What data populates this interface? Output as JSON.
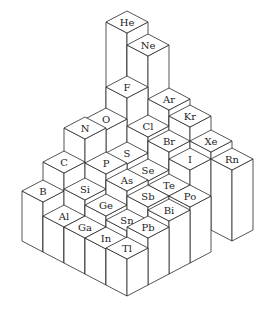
{
  "diagram": {
    "type": "isometric-column-chart",
    "groups": [
      "13",
      "14",
      "15",
      "16",
      "17",
      "18"
    ],
    "periods": [
      "1",
      "2",
      "3",
      "4",
      "5",
      "6"
    ],
    "elements": [
      {
        "symbol": "He",
        "group": 5,
        "period": -1,
        "height": 153
      },
      {
        "symbol": "B",
        "group": 0,
        "period": 0,
        "height": 50
      },
      {
        "symbol": "C",
        "group": 1,
        "period": 0,
        "height": 68
      },
      {
        "symbol": "N",
        "group": 2,
        "period": 0,
        "height": 91
      },
      {
        "symbol": "O",
        "group": 3,
        "period": 0,
        "height": 89
      },
      {
        "symbol": "F",
        "group": 4,
        "period": 0,
        "height": 110
      },
      {
        "symbol": "Ne",
        "group": 5,
        "period": 0,
        "height": 141
      },
      {
        "symbol": "Al",
        "group": 0,
        "period": 1,
        "height": 36
      },
      {
        "symbol": "Si",
        "group": 1,
        "period": 1,
        "height": 52
      },
      {
        "symbol": "P",
        "group": 2,
        "period": 1,
        "height": 67
      },
      {
        "symbol": "S",
        "group": 3,
        "period": 1,
        "height": 66
      },
      {
        "symbol": "Cl",
        "group": 4,
        "period": 1,
        "height": 82
      },
      {
        "symbol": "Ar",
        "group": 5,
        "period": 1,
        "height": 98
      },
      {
        "symbol": "Ga",
        "group": 0,
        "period": 2,
        "height": 36
      },
      {
        "symbol": "Ge",
        "group": 1,
        "period": 2,
        "height": 47
      },
      {
        "symbol": "As",
        "group": 2,
        "period": 2,
        "height": 61
      },
      {
        "symbol": "Se",
        "group": 3,
        "period": 2,
        "height": 60
      },
      {
        "symbol": "Br",
        "group": 4,
        "period": 2,
        "height": 78
      },
      {
        "symbol": "Kr",
        "group": 5,
        "period": 2,
        "height": 92
      },
      {
        "symbol": "In",
        "group": 0,
        "period": 3,
        "height": 36
      },
      {
        "symbol": "Sn",
        "group": 1,
        "period": 3,
        "height": 43
      },
      {
        "symbol": "Sb",
        "group": 2,
        "period": 3,
        "height": 56
      },
      {
        "symbol": "Te",
        "group": 3,
        "period": 3,
        "height": 56
      },
      {
        "symbol": "I",
        "group": 4,
        "period": 3,
        "height": 71
      },
      {
        "symbol": "Xe",
        "group": 5,
        "period": 3,
        "height": 78
      },
      {
        "symbol": "Tl",
        "group": 0,
        "period": 4,
        "height": 37
      },
      {
        "symbol": "Pb",
        "group": 1,
        "period": 4,
        "height": 47
      },
      {
        "symbol": "Bi",
        "group": 2,
        "period": 4,
        "height": 53
      },
      {
        "symbol": "Po",
        "group": 3,
        "period": 4,
        "height": 56
      },
      {
        "symbol": "Rn",
        "group": 5,
        "period": 4,
        "height": 71
      }
    ]
  },
  "colors": {
    "background": "#ffffff",
    "face_fill": "#ffffff",
    "edge_stroke": "#2a2a2a",
    "label_color": "#222222"
  }
}
